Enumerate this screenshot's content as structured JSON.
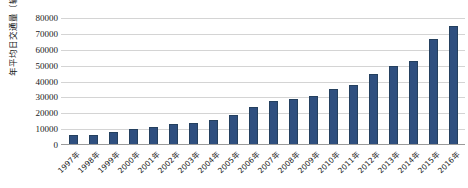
{
  "chart_data": {
    "type": "bar",
    "title": "",
    "xlabel": "",
    "ylabel": "年平均日交通量（辆/日）",
    "ylim": [
      0,
      80000
    ],
    "ytick_step": 10000,
    "yticks": [
      "80000",
      "70000",
      "60000",
      "50000",
      "40000",
      "30000",
      "20000",
      "10000",
      "0"
    ],
    "grid": true,
    "legend": "none",
    "bar_color": "#2f4f7f",
    "grid_color": "#d4d4d4",
    "axis_color": "#9a9a9a",
    "categories": [
      "1997年",
      "1998年",
      "1999年",
      "2000年",
      "2001年",
      "2002年",
      "2003年",
      "2004年",
      "2005年",
      "2006年",
      "2007年",
      "2008年",
      "2009年",
      "2010年",
      "2011年",
      "2012年",
      "2013年",
      "2014年",
      "2015年",
      "2016年"
    ],
    "values": [
      6000,
      6500,
      8000,
      10000,
      11500,
      13000,
      14000,
      16000,
      19000,
      24000,
      28000,
      29000,
      31000,
      35000,
      38000,
      45000,
      50000,
      53000,
      67000,
      75000
    ]
  }
}
